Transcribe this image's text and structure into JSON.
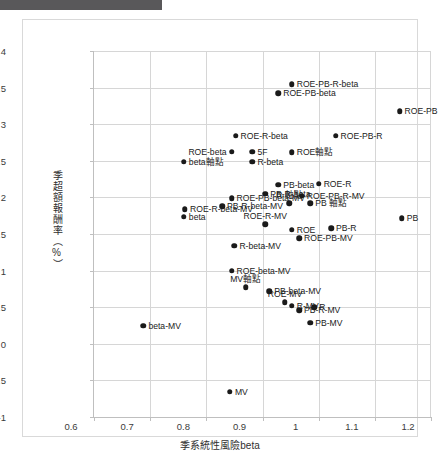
{
  "chart_data": {
    "type": "scatter",
    "title": "",
    "xlabel": "季系統性風險beta",
    "ylabel": "季超額報酬率（%）",
    "xlim": [
      0.6,
      1.2
    ],
    "ylim": [
      -1,
      4
    ],
    "xticks": [
      "0.6",
      "0.7",
      "0.8",
      "0.9",
      "1",
      "1.1",
      "1.2"
    ],
    "xtick_values": [
      0.6,
      0.7,
      0.8,
      0.9,
      1.0,
      1.1,
      1.2
    ],
    "yticks": [
      "4",
      "3.5",
      "3",
      "2.5",
      "2",
      "1.5",
      "1",
      "0.5",
      "0",
      "-0.5",
      "-1"
    ],
    "ytick_values": [
      4,
      3.5,
      3,
      2.5,
      2,
      1.5,
      1,
      0.5,
      0,
      -0.5,
      -1
    ],
    "grid": true,
    "legend": "none",
    "points": [
      {
        "label": "ROE-PB-R-beta",
        "x": 0.952,
        "y": 3.545,
        "anchor": "right"
      },
      {
        "label": "ROE-PB-beta",
        "x": 0.928,
        "y": 3.425,
        "anchor": "right"
      },
      {
        "label": "ROE-PB",
        "x": 1.144,
        "y": 3.175,
        "anchor": "right"
      },
      {
        "label": "ROE-R-beta",
        "x": 0.852,
        "y": 2.845,
        "anchor": "right"
      },
      {
        "label": "ROE-PB-R",
        "x": 1.03,
        "y": 2.845,
        "anchor": "right"
      },
      {
        "label": "ROE-beta",
        "x": 0.845,
        "y": 2.625,
        "anchor": "left"
      },
      {
        "label": "5F",
        "x": 0.882,
        "y": 2.625,
        "anchor": "right"
      },
      {
        "label": "ROE軸點",
        "x": 0.952,
        "y": 2.62,
        "anchor": "right"
      },
      {
        "label": "beta軸點",
        "x": 0.76,
        "y": 2.49,
        "anchor": "right"
      },
      {
        "label": "R-beta",
        "x": 0.882,
        "y": 2.49,
        "anchor": "right"
      },
      {
        "label": "PB-beta",
        "x": 0.928,
        "y": 2.175,
        "anchor": "right"
      },
      {
        "label": "ROE-R",
        "x": 1.0,
        "y": 2.185,
        "anchor": "right"
      },
      {
        "label": "PB-R-beta",
        "x": 0.905,
        "y": 2.05,
        "anchor": "right"
      },
      {
        "label": "ROE-PB-R-MV",
        "x": 0.97,
        "y": 2.025,
        "anchor": "right"
      },
      {
        "label": "ROE-PB-beta-MV",
        "x": 0.845,
        "y": 1.99,
        "anchor": "right"
      },
      {
        "label": "R 軸點",
        "x": 0.948,
        "y": 1.92,
        "anchor": "center"
      },
      {
        "label": "PB 軸點",
        "x": 0.985,
        "y": 1.92,
        "anchor": "right"
      },
      {
        "label": "ROE-R-beta-MV",
        "x": 0.762,
        "y": 1.835,
        "anchor": "right"
      },
      {
        "label": "PB-R-beta-MV",
        "x": 0.828,
        "y": 1.88,
        "anchor": "right"
      },
      {
        "label": "beta",
        "x": 0.76,
        "y": 1.735,
        "anchor": "right"
      },
      {
        "label": "PB",
        "x": 1.148,
        "y": 1.715,
        "anchor": "right"
      },
      {
        "label": "ROE-R-MV",
        "x": 0.905,
        "y": 1.63,
        "anchor": "center"
      },
      {
        "label": "ROE",
        "x": 0.952,
        "y": 1.56,
        "anchor": "right"
      },
      {
        "label": "PB-R",
        "x": 1.022,
        "y": 1.58,
        "anchor": "right"
      },
      {
        "label": "ROE-PB-MV",
        "x": 0.965,
        "y": 1.445,
        "anchor": "right"
      },
      {
        "label": "R-beta-MV",
        "x": 0.85,
        "y": 1.34,
        "anchor": "right"
      },
      {
        "label": "ROE-beta-MV",
        "x": 0.845,
        "y": 1.0,
        "anchor": "right"
      },
      {
        "label": "MV軸點",
        "x": 0.87,
        "y": 0.775,
        "anchor": "center"
      },
      {
        "label": "PB-beta-MV",
        "x": 0.912,
        "y": 0.72,
        "anchor": "right"
      },
      {
        "label": "ROE-MV",
        "x": 0.94,
        "y": 0.565,
        "anchor": "center"
      },
      {
        "label": "R-MV",
        "x": 0.952,
        "y": 0.52,
        "anchor": "right"
      },
      {
        "label": "PB-R-MV",
        "x": 0.965,
        "y": 0.455,
        "anchor": "right"
      },
      {
        "label": "R",
        "x": 0.992,
        "y": 0.5,
        "anchor": "right"
      },
      {
        "label": "PB-MV",
        "x": 0.985,
        "y": 0.285,
        "anchor": "right"
      },
      {
        "label": "beta-MV",
        "x": 0.688,
        "y": 0.25,
        "anchor": "right"
      },
      {
        "label": "MV",
        "x": 0.842,
        "y": -0.655,
        "anchor": "right"
      }
    ]
  }
}
